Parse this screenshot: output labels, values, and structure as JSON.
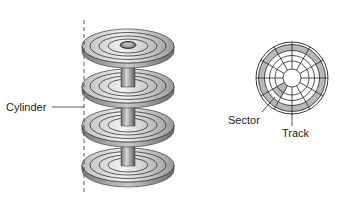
{
  "labels": {
    "cylinder": "Cylinder",
    "sector": "Sector",
    "track": "Track"
  },
  "colors": {
    "platter_light": "#e6e6e6",
    "platter_dark": "#8a8a8a",
    "shade": "#b8b8b8",
    "line": "#222222"
  }
}
